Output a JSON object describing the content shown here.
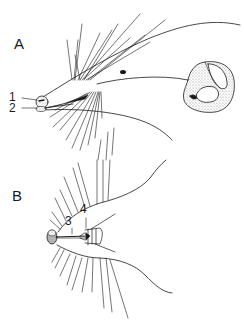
{
  "figure": {
    "panels": [
      {
        "id": "A",
        "label": "A",
        "view": "lateral view of head",
        "annotations": [
          {
            "label": "1"
          },
          {
            "label": "2"
          }
        ]
      },
      {
        "id": "B",
        "label": "B",
        "view": "ventral view of head",
        "annotations": [
          {
            "label": "3"
          },
          {
            "label": "4"
          }
        ]
      }
    ],
    "colors": {
      "ink": "#1a1a1a",
      "stipple": "#9a9a9a",
      "background": "#ffffff"
    }
  }
}
